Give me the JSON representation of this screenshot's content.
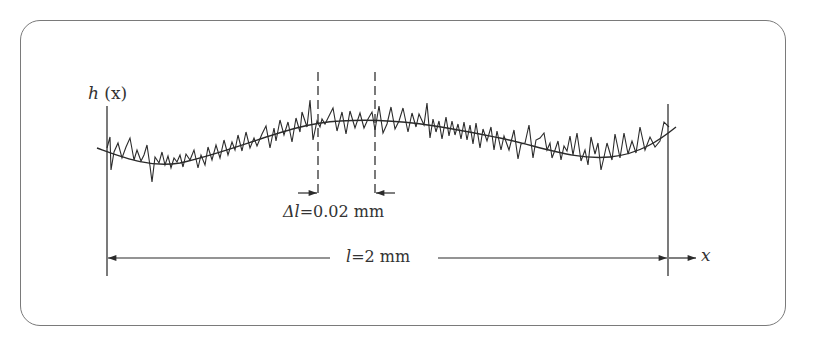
{
  "figure": {
    "type": "surface-roughness-profile",
    "y_axis_label": "h (x)",
    "x_axis_label": "x",
    "sampling_interval_label": "Δl=0.02 mm",
    "length_label": "l=2 mm",
    "colors": {
      "line": "#2b2b2b",
      "frame": "#7a7a7a",
      "background": "#ffffff"
    }
  },
  "labels": {
    "h_func": "h",
    "h_arg": "(x)",
    "delta_symbol": "Δl",
    "delta_value": "=0.02 mm",
    "l_symbol": "l",
    "l_value": "=2 mm",
    "x": "x"
  }
}
